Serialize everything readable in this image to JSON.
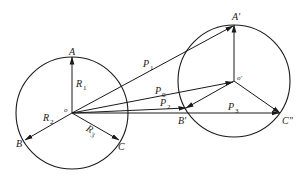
{
  "figure": {
    "type": "vector-diagram",
    "colors": {
      "ink": "#1a1a1a",
      "background": "#ffffff"
    }
  },
  "left_circle": {
    "center_label": "o",
    "points": {
      "A": "A",
      "B": "B",
      "C": "C"
    },
    "vectors": [
      {
        "name": "R",
        "sub": "1",
        "from": "o",
        "to": "A"
      },
      {
        "name": "R",
        "sub": "2",
        "from": "o",
        "to": "B"
      },
      {
        "name": "R",
        "sub": "3",
        "from": "o",
        "to": "C"
      }
    ]
  },
  "right_circle": {
    "center_label": "o′",
    "points": {
      "A": "A′",
      "B": "B′",
      "C": "C″"
    }
  },
  "position_vectors": [
    {
      "name": "P",
      "sub": "1",
      "from": "o",
      "to": "A′"
    },
    {
      "name": "P",
      "sub": "0",
      "from": "o",
      "to": "o′"
    },
    {
      "name": "P",
      "sub": "2",
      "from": "o",
      "to": "B′"
    },
    {
      "name": "P",
      "sub": "3",
      "from": "o",
      "to": "C″"
    }
  ]
}
